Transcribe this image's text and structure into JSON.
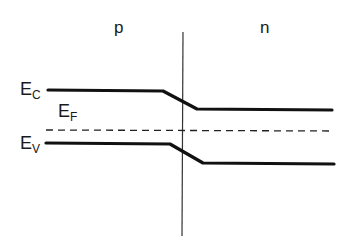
{
  "diagram": {
    "regions": [
      {
        "label": "p",
        "side": "left"
      },
      {
        "label": "n",
        "side": "right"
      }
    ],
    "levels": {
      "ec": {
        "main": "E",
        "sub": "C",
        "name": "Conduction band edge"
      },
      "ef": {
        "main": "E",
        "sub": "F",
        "name": "Fermi level"
      },
      "ev": {
        "main": "E",
        "sub": "V",
        "name": "Valence band edge"
      }
    },
    "colors": {
      "line": "#111111",
      "background": "#ffffff"
    }
  }
}
